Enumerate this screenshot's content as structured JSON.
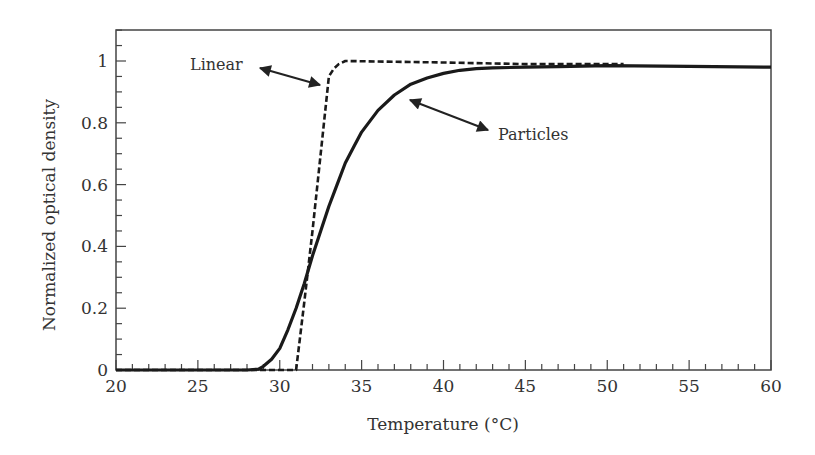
{
  "chart_data": {
    "type": "line",
    "title": "",
    "xlabel": "Temperature (°C)",
    "ylabel": "Normalized optical density",
    "xlim": [
      20,
      60
    ],
    "ylim": [
      0,
      1.1
    ],
    "xticks": [
      20,
      25,
      30,
      35,
      40,
      45,
      50,
      55,
      60
    ],
    "yticks": [
      0,
      0.2,
      0.4,
      0.6,
      0.8,
      1
    ],
    "ytick_labels": [
      "0",
      "0.2",
      "0.4",
      "0.6",
      "0.8",
      "1"
    ],
    "grid": false,
    "legend": null,
    "series": [
      {
        "name": "Particles",
        "style": "solid",
        "x": [
          20,
          25,
          28,
          28.7,
          29,
          29.5,
          30,
          30.5,
          31,
          31.5,
          32,
          32.5,
          33,
          33.5,
          34,
          34.5,
          35,
          36,
          37,
          38,
          39,
          40,
          41,
          42,
          43,
          45,
          47,
          50,
          55,
          60
        ],
        "y": [
          0,
          0,
          0,
          0.003,
          0.012,
          0.035,
          0.07,
          0.13,
          0.2,
          0.28,
          0.37,
          0.45,
          0.53,
          0.6,
          0.67,
          0.72,
          0.77,
          0.84,
          0.89,
          0.925,
          0.945,
          0.96,
          0.97,
          0.975,
          0.978,
          0.98,
          0.982,
          0.985,
          0.983,
          0.98
        ]
      },
      {
        "name": "Linear",
        "style": "dashed",
        "x": [
          20,
          25,
          30,
          31,
          31.5,
          32,
          32.5,
          33,
          33.3,
          33.6,
          34,
          40,
          45,
          51
        ],
        "y": [
          0,
          0,
          0,
          0,
          0.22,
          0.45,
          0.7,
          0.95,
          0.975,
          0.99,
          1.0,
          0.995,
          0.99,
          0.99
        ]
      }
    ],
    "annotations": [
      {
        "text": "Linear",
        "arrow_to_series": "Linear",
        "arrow": "double-headed"
      },
      {
        "text": "Particles",
        "arrow_to_series": "Particles",
        "arrow": "double-headed"
      }
    ]
  },
  "labels": {
    "linear": "Linear",
    "particles": "Particles",
    "xlabel": "Temperature (°C)",
    "ylabel": "Normalized optical density"
  }
}
